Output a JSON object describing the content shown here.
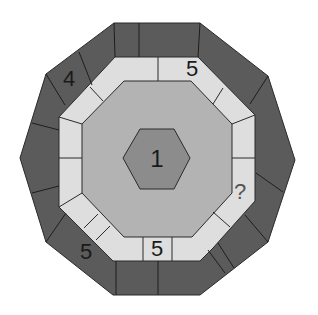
{
  "puzzle": {
    "type": "number ring puzzle",
    "colors": {
      "outer_ring": "#5b5b5b",
      "middle_ring": "#dedede",
      "inner_octagon": "#b3b3b3",
      "center_hexagon": "#8c8c8c",
      "stroke": "#2a2a2a"
    },
    "center": {
      "label": "1"
    },
    "labels": [
      {
        "id": "outer-top-left",
        "text": "4",
        "x": 69,
        "y": 79
      },
      {
        "id": "middle-top-right",
        "text": "5",
        "x": 192,
        "y": 69
      },
      {
        "id": "middle-right-lower",
        "text": "?",
        "x": 240,
        "y": 192
      },
      {
        "id": "middle-bottom",
        "text": "5",
        "x": 157,
        "y": 249
      },
      {
        "id": "outer-bottom-left",
        "text": "5",
        "x": 86,
        "y": 252
      }
    ]
  }
}
